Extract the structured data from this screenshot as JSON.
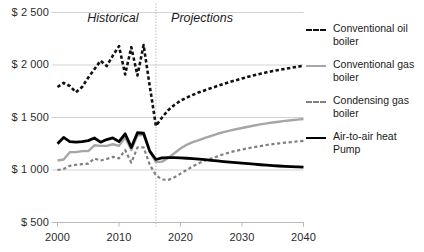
{
  "chart_data": {
    "type": "line",
    "title": "",
    "xlabel": "",
    "ylabel": "",
    "xlim": [
      2000,
      2040
    ],
    "ylim": [
      500,
      2500
    ],
    "ytick_labels": [
      "$ 2 500",
      "$ 2 000",
      "$ 1 500",
      "$ 1 000",
      "$ 500"
    ],
    "ytick_values": [
      2500,
      2000,
      1500,
      1000,
      500
    ],
    "xtick_labels": [
      "2000",
      "2010",
      "2020",
      "2030",
      "2040"
    ],
    "xtick_values": [
      2000,
      2010,
      2020,
      2030,
      2040
    ],
    "grid": true,
    "legend_position": "right",
    "annotations": [
      {
        "text": "Historical",
        "x": 2009,
        "style": "italic"
      },
      {
        "text": "Projections",
        "x": 2023.5,
        "style": "italic"
      }
    ],
    "divider": {
      "x": 2016,
      "style": "dotted"
    },
    "x": [
      2000,
      2001,
      2002,
      2003,
      2004,
      2005,
      2006,
      2007,
      2008,
      2009,
      2010,
      2011,
      2012,
      2013,
      2014,
      2015,
      2016,
      2017,
      2018,
      2019,
      2020,
      2021,
      2022,
      2023,
      2024,
      2025,
      2026,
      2027,
      2028,
      2029,
      2030,
      2031,
      2032,
      2033,
      2034,
      2035,
      2036,
      2037,
      2038,
      2039,
      2040
    ],
    "series": [
      {
        "name": "Conventional oil boiler",
        "color": "#111111",
        "style": "dashed",
        "width": 2.6,
        "values": [
          1790,
          1830,
          1800,
          1740,
          1790,
          1880,
          1960,
          2040,
          1990,
          2090,
          2180,
          1910,
          2170,
          1900,
          2190,
          1800,
          1420,
          1500,
          1570,
          1620,
          1660,
          1690,
          1715,
          1740,
          1760,
          1780,
          1800,
          1820,
          1838,
          1855,
          1872,
          1888,
          1903,
          1917,
          1930,
          1942,
          1953,
          1963,
          1973,
          1983,
          1993
        ]
      },
      {
        "name": "Conventional gas boiler",
        "color": "#a6a6a6",
        "style": "solid",
        "width": 2.4,
        "values": [
          1090,
          1100,
          1170,
          1170,
          1180,
          1180,
          1235,
          1230,
          1230,
          1245,
          1230,
          1310,
          1190,
          1330,
          1335,
          1175,
          1075,
          1080,
          1115,
          1160,
          1205,
          1240,
          1265,
          1285,
          1305,
          1325,
          1345,
          1360,
          1375,
          1388,
          1400,
          1412,
          1424,
          1434,
          1444,
          1452,
          1460,
          1468,
          1474,
          1480,
          1486
        ]
      },
      {
        "name": "Condensing gas boiler",
        "color": "#808080",
        "style": "dashed",
        "width": 2.2,
        "values": [
          1000,
          1010,
          1040,
          1050,
          1055,
          1060,
          1110,
          1090,
          1105,
          1125,
          1110,
          1190,
          1070,
          1215,
          1215,
          1050,
          950,
          910,
          905,
          930,
          965,
          1000,
          1035,
          1065,
          1090,
          1110,
          1130,
          1150,
          1168,
          1182,
          1195,
          1208,
          1218,
          1228,
          1238,
          1246,
          1253,
          1260,
          1266,
          1272,
          1278
        ]
      },
      {
        "name": "Air-to-air heat Pump",
        "color": "#000000",
        "style": "solid",
        "width": 2.8,
        "values": [
          1250,
          1310,
          1270,
          1265,
          1270,
          1280,
          1305,
          1265,
          1290,
          1305,
          1270,
          1345,
          1215,
          1355,
          1350,
          1180,
          1100,
          1115,
          1118,
          1118,
          1115,
          1112,
          1108,
          1103,
          1098,
          1092,
          1086,
          1080,
          1075,
          1070,
          1065,
          1060,
          1055,
          1050,
          1046,
          1042,
          1038,
          1035,
          1032,
          1030,
          1028
        ]
      }
    ]
  },
  "legend": {
    "items": [
      {
        "label": "Conventional oil boiler",
        "color": "#111111",
        "style": "dashed"
      },
      {
        "label": "Conventional gas boiler",
        "color": "#a6a6a6",
        "style": "solid"
      },
      {
        "label": "Condensing gas boiler",
        "color": "#808080",
        "style": "dashed"
      },
      {
        "label": "Air-to-air heat Pump",
        "color": "#000000",
        "style": "solid"
      }
    ]
  }
}
